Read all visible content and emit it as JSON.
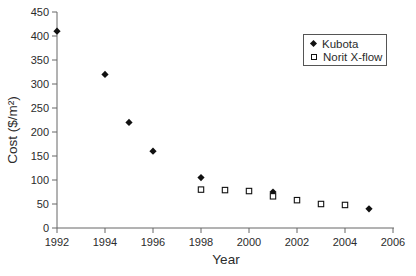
{
  "chart_data": {
    "type": "scatter",
    "title": "",
    "xlabel": "Year",
    "ylabel": "Cost ($/m²)",
    "xlim": [
      1992,
      2006
    ],
    "ylim": [
      0,
      450
    ],
    "x_ticks": [
      1992,
      1994,
      1996,
      1998,
      2000,
      2002,
      2004,
      2006
    ],
    "y_ticks": [
      0,
      50,
      100,
      150,
      200,
      250,
      300,
      350,
      400,
      450
    ],
    "grid": false,
    "legend_position": "upper-right",
    "series": [
      {
        "name": "Kubota",
        "marker": "filled-diamond",
        "color": "#111111",
        "points": [
          [
            1992,
            410
          ],
          [
            1994,
            320
          ],
          [
            1995,
            220
          ],
          [
            1996,
            160
          ],
          [
            1998,
            105
          ],
          [
            2001,
            75
          ],
          [
            2005,
            40
          ]
        ]
      },
      {
        "name": "Norit X-flow",
        "marker": "open-square",
        "color": "#111111",
        "points": [
          [
            1998,
            80
          ],
          [
            1999,
            79
          ],
          [
            2000,
            77
          ],
          [
            2001,
            66
          ],
          [
            2002,
            58
          ],
          [
            2003,
            50
          ],
          [
            2004,
            48
          ]
        ]
      }
    ]
  },
  "colors": {
    "axis": "#666666",
    "tick_text": "#2b2b2b",
    "marker": "#111111",
    "background": "#ffffff",
    "legend_border": "#555555"
  }
}
